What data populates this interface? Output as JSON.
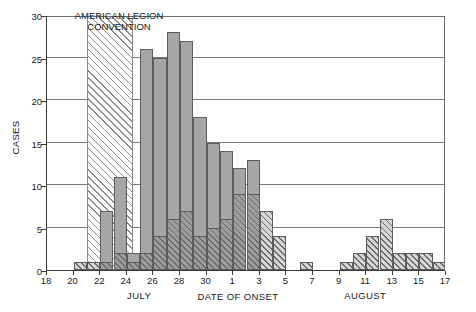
{
  "chart_data": {
    "type": "bar",
    "title": "",
    "xlabel": "DATE OF ONSET",
    "ylabel": "CASES",
    "ylim": [
      0,
      30
    ],
    "ytick_values": [
      0,
      5,
      10,
      15,
      20,
      25,
      30
    ],
    "ytick_labels": [
      "0",
      "5",
      "10",
      "15",
      "20",
      "25",
      "30"
    ],
    "grid": "horizontal",
    "legend_position": "none",
    "xlim_day_index": [
      18,
      48
    ],
    "xtick_labels": [
      "18",
      "20",
      "22",
      "24",
      "26",
      "28",
      "30",
      "1",
      "3",
      "5",
      "7",
      "9",
      "11",
      "13",
      "15",
      "17"
    ],
    "xtick_day_index": [
      18,
      20,
      22,
      24,
      26,
      28,
      30,
      32,
      34,
      36,
      38,
      40,
      42,
      44,
      46,
      48
    ],
    "month_labels": [
      {
        "text": "JULY",
        "day_index": 25
      },
      {
        "text": "AUGUST",
        "day_index": 42
      }
    ],
    "annotations": [
      {
        "text": "AMERICAN LEGION\nCONVENTION",
        "band_start_day_index": 21,
        "band_end_day_index": 24.5,
        "band_height": 30
      }
    ],
    "series": [
      {
        "name": "total-cases",
        "style": "solid-gray",
        "categories": [
          "Jul 20",
          "Jul 21",
          "Jul 22",
          "Jul 23",
          "Jul 24",
          "Jul 25",
          "Jul 26",
          "Jul 27",
          "Jul 28",
          "Jul 29",
          "Jul 30",
          "Jul 31",
          "Aug 1",
          "Aug 2",
          "Aug 3",
          "Aug 4",
          "Aug 6",
          "Aug 9",
          "Aug 10",
          "Aug 11",
          "Aug 12",
          "Aug 13",
          "Aug 14",
          "Aug 15",
          "Aug 16"
        ],
        "day_index": [
          20,
          21,
          22,
          23,
          24,
          25,
          26,
          27,
          28,
          29,
          30,
          31,
          32,
          33,
          34,
          35,
          37,
          40,
          41,
          42,
          43,
          44,
          45,
          46,
          47
        ],
        "values": [
          1,
          1,
          7,
          11,
          2,
          26,
          25,
          28,
          27,
          18,
          15,
          14,
          12,
          13,
          7,
          4,
          1,
          1,
          2,
          4,
          6,
          2,
          2,
          2,
          1
        ]
      },
      {
        "name": "hatched-subset-cases",
        "style": "diagonal-hatch",
        "day_index": [
          20,
          21,
          22,
          23,
          24,
          25,
          26,
          27,
          28,
          29,
          30,
          31,
          32,
          33,
          34,
          35,
          37,
          40,
          41,
          42,
          43,
          44,
          45,
          46,
          47
        ],
        "values": [
          1,
          1,
          1,
          2,
          1,
          2,
          4,
          6,
          7,
          4,
          5,
          6,
          9,
          9,
          7,
          4,
          1,
          1,
          2,
          4,
          6,
          2,
          2,
          2,
          1
        ]
      }
    ]
  }
}
